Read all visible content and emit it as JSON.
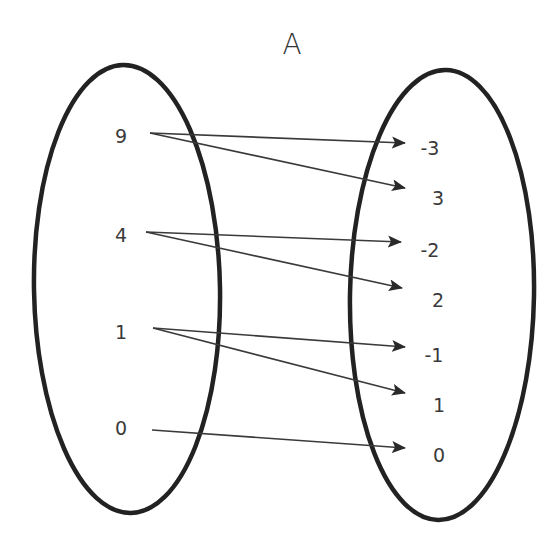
{
  "diagram": {
    "title": "A",
    "type": "mapping-diagram",
    "colors": {
      "ellipse": "#222222",
      "arrow": "#3a3a3a",
      "text": "#3a3a3a",
      "background": "#ffffff"
    },
    "domain": [
      "9",
      "4",
      "1",
      "0"
    ],
    "range": [
      "-3",
      "3",
      "-2",
      "2",
      "-1",
      "1",
      "0"
    ],
    "mappings": [
      {
        "from": "9",
        "to": "-3"
      },
      {
        "from": "9",
        "to": "3"
      },
      {
        "from": "4",
        "to": "-2"
      },
      {
        "from": "4",
        "to": "2"
      },
      {
        "from": "1",
        "to": "-1"
      },
      {
        "from": "1",
        "to": "1"
      },
      {
        "from": "0",
        "to": "0"
      }
    ]
  }
}
